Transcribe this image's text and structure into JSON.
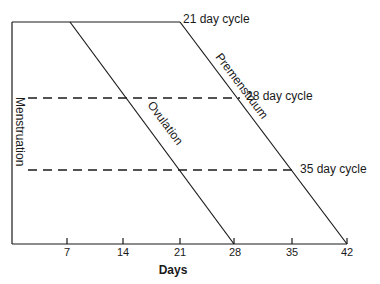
{
  "diagram": {
    "x_axis": {
      "title": "Days",
      "ticks": [
        {
          "value": 7,
          "label": "7"
        },
        {
          "value": 14,
          "label": "14"
        },
        {
          "value": 21,
          "label": "21"
        },
        {
          "value": 28,
          "label": "28"
        },
        {
          "value": 35,
          "label": "35"
        },
        {
          "value": 42,
          "label": "42"
        }
      ]
    },
    "phases": {
      "menstruation": "Menstruation",
      "ovulation": "Ovulation",
      "premenstruum": "Premenstruum"
    },
    "cycles": [
      {
        "label": "21 day cycle",
        "length_days": 21
      },
      {
        "label": "28 day cycle",
        "length_days": 28
      },
      {
        "label": "35 day cycle",
        "length_days": 35
      }
    ],
    "colors": {
      "ink": "#1a1a1a",
      "background": "#ffffff"
    }
  }
}
